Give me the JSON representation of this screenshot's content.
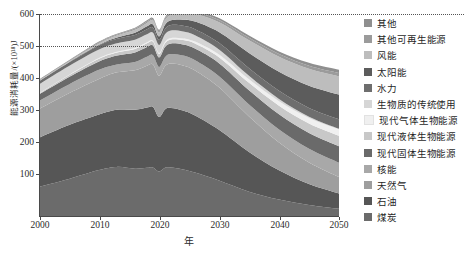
{
  "axes": {
    "y_title": "能源消耗量/(×10¹⁸)J",
    "x_title": "年",
    "y_ticks": [
      "600",
      "500",
      "400",
      "300",
      "200",
      "100"
    ],
    "x_ticks": [
      "2000",
      "2010",
      "2020",
      "2030",
      "2040",
      "2050"
    ]
  },
  "legend": {
    "items": [
      {
        "label": "其他",
        "color": "#8f8f8f"
      },
      {
        "label": "其他可再生能源",
        "color": "#9b9b9b"
      },
      {
        "label": "风能",
        "color": "#bdbdbd"
      },
      {
        "label": "太阳能",
        "color": "#5c5c5c"
      },
      {
        "label": "水力",
        "color": "#6e6e6e"
      },
      {
        "label": "生物质的传统使用",
        "color": "#d6d6d6"
      },
      {
        "label": "现代气体生物能源",
        "color": "#f0f0f0"
      },
      {
        "label": "现代液体生物能源",
        "color": "#c8c8c8"
      },
      {
        "label": "现代固体生物能源",
        "color": "#6a6a6a"
      },
      {
        "label": "核能",
        "color": "#a8a8a8"
      },
      {
        "label": "天然气",
        "color": "#9e9e9e"
      },
      {
        "label": "石油",
        "color": "#565656"
      },
      {
        "label": "煤炭",
        "color": "#6b6b6b"
      }
    ]
  },
  "chart_data": {
    "type": "area",
    "title": "",
    "xlabel": "年",
    "ylabel": "能源消耗量/(×10¹⁸)J",
    "xlim": [
      2000,
      2050
    ],
    "ylim": [
      0,
      640
    ],
    "grid": true,
    "gridlines": [
      600,
      500
    ],
    "legend_position": "right",
    "x": [
      2000,
      2005,
      2010,
      2013,
      2016,
      2018,
      2019,
      2020,
      2021,
      2022,
      2024,
      2026,
      2030,
      2035,
      2040,
      2045,
      2050
    ],
    "series": [
      {
        "name": "煤炭",
        "values": [
          95,
          120,
          148,
          158,
          152,
          155,
          156,
          143,
          155,
          156,
          150,
          140,
          115,
          80,
          55,
          38,
          26
        ]
      },
      {
        "name": "石油",
        "values": [
          155,
          170,
          175,
          180,
          186,
          190,
          191,
          172,
          184,
          188,
          186,
          180,
          160,
          125,
          92,
          66,
          48
        ]
      },
      {
        "name": "天然气",
        "values": [
          90,
          100,
          112,
          118,
          125,
          132,
          134,
          130,
          136,
          140,
          142,
          142,
          134,
          112,
          88,
          68,
          52
        ]
      },
      {
        "name": "核能",
        "values": [
          26,
          28,
          29,
          25,
          26,
          28,
          29,
          28,
          29,
          30,
          31,
          32,
          35,
          38,
          41,
          43,
          45
        ]
      },
      {
        "name": "现代固体生物能源",
        "values": [
          20,
          23,
          26,
          28,
          30,
          31,
          31,
          30,
          32,
          33,
          35,
          37,
          41,
          45,
          48,
          50,
          52
        ]
      },
      {
        "name": "现代液体生物能源",
        "values": [
          3,
          6,
          9,
          10,
          11,
          12,
          12,
          11,
          12,
          13,
          14,
          16,
          19,
          23,
          27,
          30,
          33
        ]
      },
      {
        "name": "现代气体生物能源",
        "values": [
          1,
          1,
          2,
          2,
          3,
          3,
          3,
          3,
          4,
          4,
          5,
          6,
          8,
          11,
          14,
          17,
          20
        ]
      },
      {
        "name": "生物质的传统使用",
        "values": [
          28,
          28,
          27,
          27,
          26,
          25,
          25,
          25,
          24,
          24,
          22,
          20,
          16,
          11,
          7,
          4,
          2
        ]
      },
      {
        "name": "水力",
        "values": [
          10,
          11,
          13,
          14,
          15,
          16,
          16,
          16,
          17,
          17,
          18,
          19,
          21,
          24,
          26,
          28,
          30
        ]
      },
      {
        "name": "太阳能",
        "values": [
          0,
          1,
          2,
          4,
          7,
          9,
          10,
          11,
          13,
          15,
          19,
          24,
          34,
          48,
          60,
          70,
          78
        ]
      },
      {
        "name": "风能",
        "values": [
          1,
          2,
          4,
          6,
          9,
          11,
          12,
          13,
          15,
          17,
          20,
          24,
          31,
          40,
          47,
          53,
          57
        ]
      },
      {
        "name": "其他可再生能源",
        "values": [
          2,
          2,
          3,
          3,
          4,
          4,
          4,
          4,
          5,
          5,
          5,
          6,
          7,
          8,
          9,
          10,
          11
        ]
      },
      {
        "name": "其他",
        "values": [
          2,
          2,
          3,
          3,
          3,
          4,
          4,
          4,
          4,
          4,
          5,
          5,
          6,
          7,
          8,
          9,
          10
        ]
      }
    ],
    "totals": [
      433,
      494,
      553,
      578,
      597,
      620,
      627,
      590,
      630,
      646,
      652,
      651,
      627,
      572,
      522,
      486,
      464
    ]
  },
  "caption": {
    "text": ""
  }
}
